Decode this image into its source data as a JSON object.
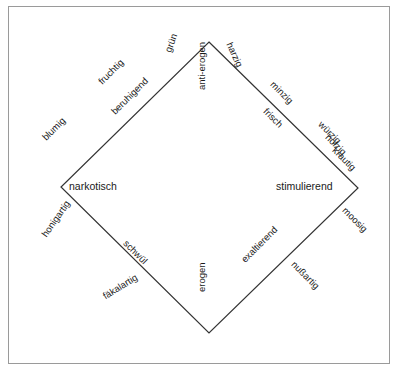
{
  "figure": {
    "type": "odor-effect-diamond-diagram",
    "shape": "diamond",
    "line_color": "#333333",
    "frame_color": "#9a9a9a",
    "background_color": "#ffffff",
    "text_color": "#1a1a1a"
  },
  "axes": {
    "horizontal": {
      "left_pole": "narkotisch",
      "right_pole": "stimulierend"
    },
    "vertical": {
      "top_pole": "anti-erogen",
      "bottom_pole": "erogen"
    }
  },
  "vertices": {
    "top": "anti-erogen",
    "right": "stimulierend",
    "bottom": "erogen",
    "left": "narkotisch"
  },
  "labels": {
    "narkotisch": "narkotisch",
    "stimulierend": "stimulierend",
    "anti_erogen": "anti-erogen",
    "erogen": "erogen",
    "gruen": "grün",
    "harzig": "harzig",
    "fruchtig": "fruchtig",
    "beruhigend": "beruhigend",
    "blumig": "blumig",
    "minzig": "minzig",
    "frisch": "frisch",
    "wuerzig": "würzig",
    "holzig": "holzig",
    "krautig": "krautig",
    "moosig": "moosig",
    "nussartig": "nußartig",
    "exaltierend": "exaltierend",
    "schwuel": "schwül",
    "honigartig": "honigartig",
    "faekalartig": "fäkalartig"
  },
  "quadrants": {
    "upper_left": {
      "between": [
        "anti-erogen",
        "narkotisch"
      ],
      "inner_label": "beruhigend",
      "outer_labels": [
        "grün",
        "fruchtig",
        "blumig"
      ]
    },
    "upper_right": {
      "between": [
        "anti-erogen",
        "stimulierend"
      ],
      "inner_label": "frisch",
      "outer_labels": [
        "harzig",
        "minzig",
        "würzig",
        "holzig",
        "krautig"
      ]
    },
    "lower_right": {
      "between": [
        "stimulierend",
        "erogen"
      ],
      "inner_label": "exaltierend",
      "outer_labels": [
        "moosig",
        "nußartig"
      ]
    },
    "lower_left": {
      "between": [
        "erogen",
        "narkotisch"
      ],
      "inner_label": "schwül",
      "outer_labels": [
        "honigartig",
        "fäkalartig"
      ]
    }
  }
}
